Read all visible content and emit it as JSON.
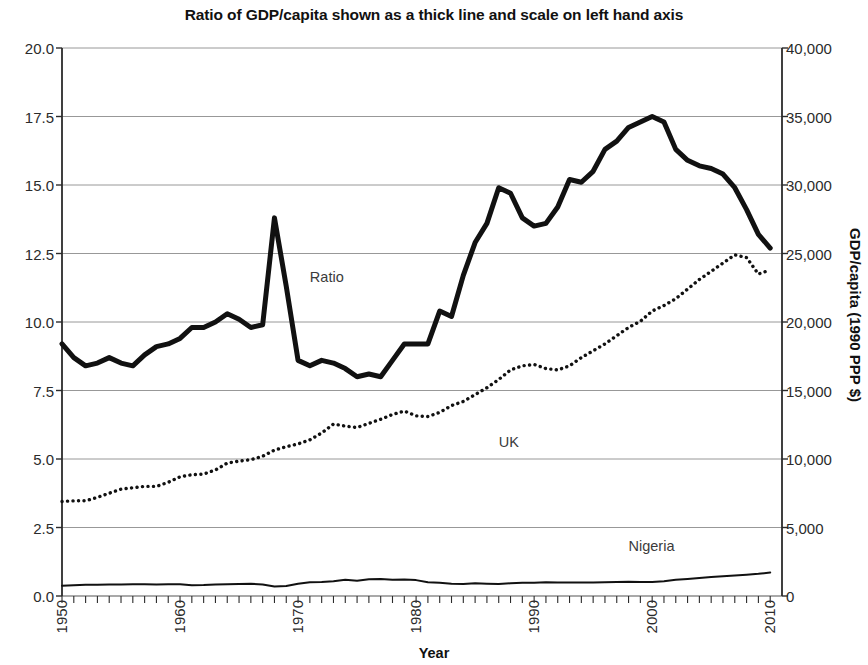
{
  "chart_data": {
    "type": "line",
    "title": "Ratio of GDP/capita shown as a thick line and scale on left hand axis",
    "xlabel": "Year",
    "ylabel": "",
    "ylabel_right": "GDP/capita (1990 PPP $)",
    "grid": true,
    "legend_position": "inline-annotations",
    "xlim": [
      1950,
      2011
    ],
    "ylim": [
      0.0,
      20.0
    ],
    "ylim_right": [
      0,
      40000
    ],
    "ytick_labels_left": [
      "0.0",
      "2.5",
      "5.0",
      "7.5",
      "10.0",
      "12.5",
      "15.0",
      "17.5",
      "20.0"
    ],
    "ytick_values_left": [
      0.0,
      2.5,
      5.0,
      7.5,
      10.0,
      12.5,
      15.0,
      17.5,
      20.0
    ],
    "ytick_labels_right": [
      "0",
      "5,000",
      "10,000",
      "15,000",
      "20,000",
      "25,000",
      "30,000",
      "35,000",
      "40,000"
    ],
    "ytick_values_right": [
      0,
      5000,
      10000,
      15000,
      20000,
      25000,
      30000,
      35000,
      40000
    ],
    "xtick_labels": [
      "1950",
      "1960",
      "1970",
      "1980",
      "1990",
      "2000",
      "2010"
    ],
    "xtick_values": [
      1950,
      1960,
      1970,
      1980,
      1990,
      2000,
      2010
    ],
    "x": [
      1950,
      1951,
      1952,
      1953,
      1954,
      1955,
      1956,
      1957,
      1958,
      1959,
      1960,
      1961,
      1962,
      1963,
      1964,
      1965,
      1966,
      1967,
      1968,
      1969,
      1970,
      1971,
      1972,
      1973,
      1974,
      1975,
      1976,
      1977,
      1978,
      1979,
      1980,
      1981,
      1982,
      1983,
      1984,
      1985,
      1986,
      1987,
      1988,
      1989,
      1990,
      1991,
      1992,
      1993,
      1994,
      1995,
      1996,
      1997,
      1998,
      1999,
      2000,
      2001,
      2002,
      2003,
      2004,
      2005,
      2006,
      2007,
      2008,
      2009,
      2010
    ],
    "series": [
      {
        "name": "Ratio",
        "axis": "left",
        "style": "thick-solid",
        "values": [
          9.2,
          8.7,
          8.4,
          8.5,
          8.7,
          8.5,
          8.4,
          8.8,
          9.1,
          9.2,
          9.4,
          9.8,
          9.8,
          10.0,
          10.3,
          10.1,
          9.8,
          9.9,
          13.8,
          11.3,
          8.6,
          8.4,
          8.6,
          8.5,
          8.3,
          8.0,
          8.1,
          8.0,
          8.6,
          9.2,
          9.2,
          9.2,
          10.4,
          10.2,
          11.7,
          12.9,
          13.6,
          14.9,
          14.7,
          13.8,
          13.5,
          13.6,
          14.2,
          15.2,
          15.1,
          15.5,
          16.3,
          16.6,
          17.1,
          17.3,
          17.5,
          17.3,
          16.3,
          15.9,
          15.7,
          15.6,
          15.4,
          14.9,
          14.1,
          13.2,
          12.7
        ]
      },
      {
        "name": "UK",
        "axis": "right",
        "style": "dotted",
        "values": [
          6900,
          6950,
          6950,
          7200,
          7500,
          7800,
          7900,
          8000,
          8000,
          8300,
          8700,
          8850,
          8900,
          9200,
          9700,
          9850,
          9950,
          10200,
          10650,
          10900,
          11100,
          11400,
          11900,
          12550,
          12400,
          12300,
          12600,
          12900,
          13250,
          13500,
          13150,
          13100,
          13400,
          13900,
          14200,
          14700,
          15200,
          15800,
          16500,
          16800,
          16900,
          16600,
          16500,
          16800,
          17400,
          17900,
          18400,
          19000,
          19600,
          20050,
          20800,
          21200,
          21700,
          22400,
          23100,
          23700,
          24300,
          24900,
          24700,
          23500,
          23800
        ]
      },
      {
        "name": "Nigeria",
        "axis": "right",
        "style": "thin-solid",
        "values": [
          750,
          790,
          820,
          830,
          840,
          845,
          850,
          850,
          845,
          850,
          855,
          790,
          800,
          840,
          860,
          880,
          890,
          840,
          700,
          730,
          900,
          1000,
          1030,
          1080,
          1180,
          1120,
          1230,
          1250,
          1180,
          1200,
          1160,
          1000,
          960,
          900,
          880,
          930,
          900,
          880,
          930,
          960,
          960,
          1000,
          980,
          980,
          980,
          980,
          1000,
          1030,
          1040,
          1030,
          1030,
          1080,
          1180,
          1250,
          1320,
          1380,
          1450,
          1500,
          1550,
          1620,
          1720
        ]
      }
    ],
    "annotations": [
      {
        "text": "Ratio",
        "x": 1971,
        "y_axis": "left",
        "y": 11.6
      },
      {
        "text": "UK",
        "x": 1987,
        "y_axis": "right",
        "y": 11200
      },
      {
        "text": "Nigeria",
        "x": 1998,
        "y_axis": "right",
        "y": 3600
      }
    ]
  }
}
